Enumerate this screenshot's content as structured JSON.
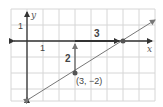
{
  "diagram": {
    "grid": {
      "unit_px": 16,
      "origin_px": [
        27,
        41
      ],
      "x_range": [
        -1,
        8
      ],
      "y_range": [
        -3.7,
        2
      ],
      "color": "#d0d0d0"
    },
    "axes": {
      "x_label": "x",
      "y_label": "y",
      "x_tick_label": "1",
      "y_tick_label": "1",
      "color": "#333333"
    },
    "line": {
      "from": [
        0.1,
        -3.6
      ],
      "to": [
        8,
        1.3
      ],
      "color": "#777777"
    },
    "point_a": {
      "coords": [
        3,
        -2
      ],
      "label": "(3, −2)"
    },
    "point_b": {
      "coords": [
        6,
        0
      ]
    },
    "rise": {
      "label": "2",
      "from": [
        3,
        -2
      ],
      "to": [
        3,
        0
      ]
    },
    "run": {
      "label": "3",
      "from": [
        3,
        0
      ],
      "to": [
        6,
        0
      ]
    },
    "point_color": "#555555"
  }
}
